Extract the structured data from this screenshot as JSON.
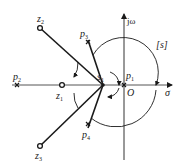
{
  "diagram": {
    "plane_label": "[s]",
    "axes": {
      "real_label": "σ",
      "imag_label": "jω",
      "origin_label": "O"
    },
    "test_point": {
      "name": "s",
      "sub": "1"
    },
    "poles": [
      {
        "name": "p",
        "sub": "1",
        "x": 124,
        "y": 85
      },
      {
        "name": "p",
        "sub": "2",
        "x": 17,
        "y": 85
      },
      {
        "name": "p",
        "sub": "3",
        "x": 88,
        "y": 42
      },
      {
        "name": "p",
        "sub": "4",
        "x": 88,
        "y": 124
      }
    ],
    "zeros": [
      {
        "name": "z",
        "sub": "1",
        "x": 62,
        "y": 85
      },
      {
        "name": "z",
        "sub": "2",
        "x": 40,
        "y": 28
      },
      {
        "name": "z",
        "sub": "3",
        "x": 40,
        "y": 146
      }
    ],
    "colors": {
      "line": "#1a1a1a",
      "axis": "#333333"
    }
  }
}
